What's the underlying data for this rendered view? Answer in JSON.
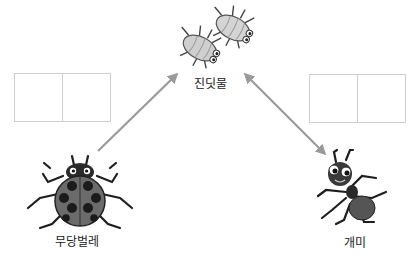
{
  "diagram": {
    "nodes": {
      "aphid": {
        "label": "진딧물",
        "icon": "aphid-icon"
      },
      "ladybug": {
        "label": "무당벌레",
        "icon": "ladybug-icon"
      },
      "ant": {
        "label": "개미",
        "icon": "ant-icon"
      }
    },
    "edges": [
      {
        "from": "ladybug",
        "to": "aphid",
        "type": "single-arrow"
      },
      {
        "from": "ant",
        "to": "aphid",
        "type": "double-arrow"
      }
    ],
    "answer_boxes": {
      "left": {
        "cells": [
          "",
          ""
        ]
      },
      "right": {
        "cells": [
          "",
          ""
        ]
      }
    },
    "colors": {
      "arrow": "#9a9a9a",
      "box_border": "#cfcfcf",
      "insect_dark": "#2a2a2a",
      "insect_mid": "#6b6b6b",
      "aphid_body": "#c9c9c9"
    }
  }
}
